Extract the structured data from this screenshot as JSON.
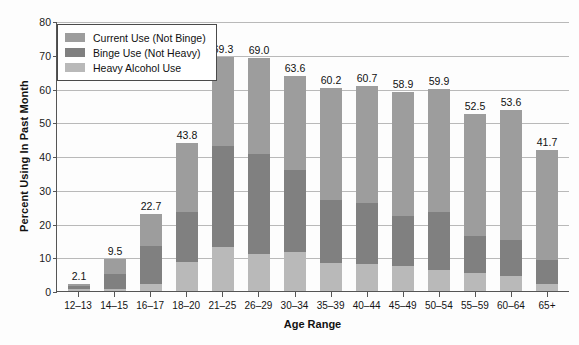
{
  "chart_data": {
    "type": "bar",
    "stacked": true,
    "title": "",
    "xlabel": "Age Range",
    "ylabel": "Percent Using In Past Month",
    "ylim": [
      0,
      80
    ],
    "yticks": [
      0,
      10,
      20,
      30,
      40,
      50,
      60,
      70,
      80
    ],
    "grid": true,
    "legend_position": "top-left",
    "categories": [
      "12–13",
      "14–15",
      "16–17",
      "18–20",
      "21–25",
      "26–29",
      "30–34",
      "35–39",
      "40–44",
      "45–49",
      "50–54",
      "55–59",
      "60–64",
      "65+"
    ],
    "totals": [
      2.1,
      9.5,
      22.7,
      43.8,
      69.3,
      69.0,
      63.6,
      60.2,
      60.7,
      58.9,
      59.9,
      52.5,
      53.6,
      41.7
    ],
    "total_labels": [
      "2.1",
      "9.5",
      "22.7",
      "43.8",
      "69.3",
      "69.0",
      "63.6",
      "60.2",
      "60.7",
      "58.9",
      "59.9",
      "52.5",
      "53.6",
      "41.7"
    ],
    "series": [
      {
        "name": "Heavy Alcohol Use",
        "color": "#b9b9b9",
        "stack_order": 0,
        "values": [
          0.6,
          0.5,
          2.1,
          8.5,
          13.1,
          11.0,
          11.5,
          8.4,
          8.0,
          7.4,
          6.2,
          5.4,
          4.5,
          2.0
        ]
      },
      {
        "name": "Binge Use (Not Heavy)",
        "color": "#808080",
        "stack_order": 1,
        "values": [
          1.0,
          4.5,
          11.3,
          15.0,
          30.0,
          29.5,
          24.5,
          18.6,
          18.0,
          14.9,
          17.3,
          10.8,
          10.5,
          7.2
        ]
      },
      {
        "name": "Current Use (Not Binge)",
        "color": "#9d9d9d",
        "stack_order": 2,
        "values": [
          0.5,
          4.5,
          9.3,
          20.3,
          26.2,
          28.5,
          27.6,
          33.2,
          34.7,
          36.6,
          36.4,
          36.3,
          38.6,
          32.5
        ]
      }
    ],
    "legend_entries": [
      {
        "label": "Current Use (Not Binge)",
        "color": "#9d9d9d"
      },
      {
        "label": "Binge Use (Not Heavy)",
        "color": "#808080"
      },
      {
        "label": "Heavy Alcohol Use",
        "color": "#b9b9b9"
      }
    ]
  }
}
